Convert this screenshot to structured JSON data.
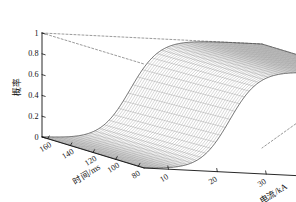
{
  "chart_data": {
    "type": "surface",
    "title": "",
    "subtitle": "",
    "xlabel": "电流/kA",
    "ylabel": "时间/ms",
    "zlabel": "概率",
    "x_name": "current",
    "y_name": "time",
    "z_name": "probability",
    "xlim": [
      5,
      50
    ],
    "ylim": [
      75,
      165
    ],
    "zlim": [
      0,
      1
    ],
    "xticks": [
      10,
      20,
      30,
      40,
      50
    ],
    "xticklabels": [
      "10",
      "20",
      "30",
      "40",
      "50"
    ],
    "yticks": [
      160,
      140,
      120,
      100,
      80
    ],
    "yticklabels": [
      "160",
      "140",
      "120",
      "100",
      "80"
    ],
    "zticks": [
      0,
      0.2,
      0.4,
      0.6,
      0.8,
      1
    ],
    "zticklabels": [
      "0",
      "0.2",
      "0.4",
      "0.6",
      "0.8",
      "1"
    ],
    "grid": true,
    "legend": null,
    "mesh_color": "#6e6e6e",
    "axis_color": "#111111",
    "dashed_color": "#555555",
    "background": "#ffffff",
    "x": [
      5,
      10,
      15,
      20,
      22.5,
      25,
      27.5,
      30,
      35,
      40,
      45,
      50
    ],
    "y": [
      80,
      90,
      100,
      110,
      120,
      130,
      140,
      150,
      160
    ],
    "z": [
      [
        0.0,
        0.01,
        0.05,
        0.3,
        0.52,
        0.72,
        0.86,
        0.94,
        0.99,
        1.0,
        1.0,
        1.0
      ],
      [
        0.0,
        0.01,
        0.05,
        0.29,
        0.51,
        0.71,
        0.85,
        0.93,
        0.99,
        1.0,
        1.0,
        1.0
      ],
      [
        0.0,
        0.01,
        0.04,
        0.28,
        0.5,
        0.7,
        0.85,
        0.93,
        0.99,
        1.0,
        1.0,
        1.0
      ],
      [
        0.0,
        0.01,
        0.04,
        0.27,
        0.49,
        0.69,
        0.84,
        0.93,
        0.99,
        1.0,
        1.0,
        1.0
      ],
      [
        0.0,
        0.01,
        0.04,
        0.26,
        0.48,
        0.68,
        0.84,
        0.92,
        0.98,
        1.0,
        1.0,
        1.0
      ],
      [
        0.0,
        0.01,
        0.04,
        0.25,
        0.47,
        0.68,
        0.83,
        0.92,
        0.98,
        1.0,
        1.0,
        1.0
      ],
      [
        0.0,
        0.01,
        0.03,
        0.24,
        0.46,
        0.67,
        0.83,
        0.92,
        0.98,
        1.0,
        1.0,
        1.0
      ],
      [
        0.0,
        0.01,
        0.03,
        0.24,
        0.45,
        0.66,
        0.82,
        0.91,
        0.98,
        1.0,
        1.0,
        1.0
      ],
      [
        0.0,
        0.01,
        0.03,
        0.23,
        0.45,
        0.66,
        0.82,
        0.91,
        0.98,
        1.0,
        1.0,
        1.0
      ]
    ],
    "surface_model": {
      "form": "logistic",
      "midpoint_current_kA": 22.5,
      "slope": 0.33,
      "time_shift_per_ms": 0.006
    }
  }
}
